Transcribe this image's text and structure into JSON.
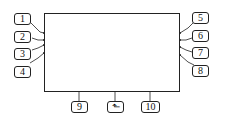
{
  "diagram": {
    "left_callouts": [
      {
        "label": "1"
      },
      {
        "label": "2"
      },
      {
        "label": "3"
      },
      {
        "label": "4"
      }
    ],
    "right_callouts": [
      {
        "label": "5"
      },
      {
        "label": "6"
      },
      {
        "label": "7"
      },
      {
        "label": "8"
      }
    ],
    "bottom_callouts": [
      {
        "label": "9"
      },
      {
        "label": "return-icon",
        "glyph": "⬑"
      },
      {
        "label": "10"
      }
    ],
    "colors": {
      "line": "#222222",
      "background": "#ffffff"
    }
  }
}
